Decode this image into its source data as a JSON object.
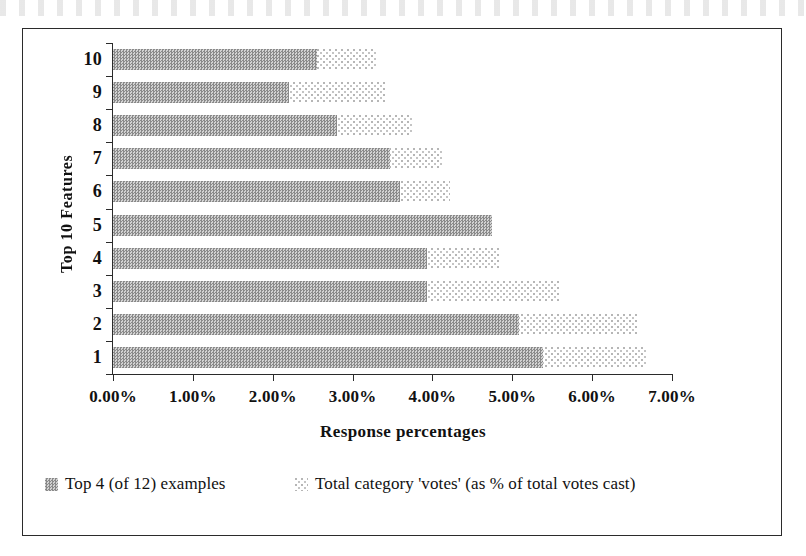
{
  "chart_data": {
    "type": "bar",
    "orientation": "horizontal",
    "title": "",
    "xlabel": "Response percentages",
    "ylabel": "Top 10 Features",
    "categories": [
      "10",
      "9",
      "8",
      "7",
      "6",
      "5",
      "4",
      "3",
      "2",
      "1"
    ],
    "xlim": [
      0,
      7
    ],
    "x_tick_labels": [
      "0.00%",
      "1.00%",
      "2.00%",
      "3.00%",
      "4.00%",
      "5.00%",
      "6.00%",
      "7.00%"
    ],
    "x_tick_values": [
      0,
      1,
      2,
      3,
      4,
      5,
      6,
      7
    ],
    "grid": false,
    "legend_position": "bottom",
    "series": [
      {
        "name": "Top 4 (of 12) examples",
        "fill": "dark-checker",
        "color": "#9a9a9a",
        "values": [
          2.55,
          2.2,
          2.8,
          3.47,
          3.6,
          4.75,
          3.93,
          3.93,
          5.08,
          5.38
        ]
      },
      {
        "name": "Total category 'votes' (as % of total votes cast)",
        "fill": "light-dotted",
        "color": "#e2e2e2",
        "values": [
          3.3,
          3.4,
          3.74,
          4.12,
          4.22,
          4.75,
          4.84,
          5.6,
          6.56,
          6.67
        ]
      }
    ]
  },
  "axes": {
    "y_title": "Top 10 Features",
    "x_title": "Response percentages"
  },
  "legend": {
    "entries": [
      {
        "label": "Top 4 (of 12) examples",
        "swatch": "dark-checker"
      },
      {
        "label": "Total category 'votes' (as % of total votes cast)",
        "swatch": "light-dotted"
      }
    ]
  },
  "colors": {
    "frame": "#2b2b2b",
    "axis": "#2b2b2b",
    "text": "#111111",
    "series_dark": "#9a9a9a",
    "series_light": "#e2e2e2",
    "background": "#ffffff"
  }
}
